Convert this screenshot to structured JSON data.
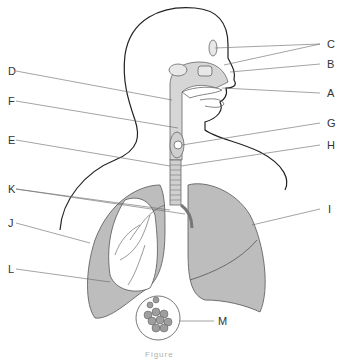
{
  "diagram": {
    "type": "anatomical-labeling-diagram",
    "labels": [
      {
        "id": "C",
        "text": "C",
        "x": 327,
        "y": 41,
        "targets": [
          "frontal sinus",
          "nasal cavity"
        ]
      },
      {
        "id": "B",
        "text": "B",
        "x": 327,
        "y": 61
      },
      {
        "id": "A",
        "text": "A",
        "x": 327,
        "y": 90
      },
      {
        "id": "D",
        "text": "D",
        "x": 8,
        "y": 68
      },
      {
        "id": "F",
        "text": "F",
        "x": 8,
        "y": 98
      },
      {
        "id": "G",
        "text": "G",
        "x": 327,
        "y": 120
      },
      {
        "id": "E",
        "text": "E",
        "x": 8,
        "y": 137
      },
      {
        "id": "H",
        "text": "H",
        "x": 327,
        "y": 142
      },
      {
        "id": "K",
        "text": "K",
        "x": 8,
        "y": 186
      },
      {
        "id": "I",
        "text": "I",
        "x": 328,
        "y": 206
      },
      {
        "id": "J",
        "text": "J",
        "x": 8,
        "y": 220
      },
      {
        "id": "L",
        "text": "L",
        "x": 8,
        "y": 266
      },
      {
        "id": "M",
        "text": "M",
        "x": 218,
        "y": 318
      }
    ],
    "caption": "Figure",
    "colors": {
      "outline": "#222222",
      "leader_line": "#555555",
      "lung_fill": "#bdbdbd",
      "airway_fill": "#d6d6d6",
      "label_text": "#333333"
    }
  }
}
